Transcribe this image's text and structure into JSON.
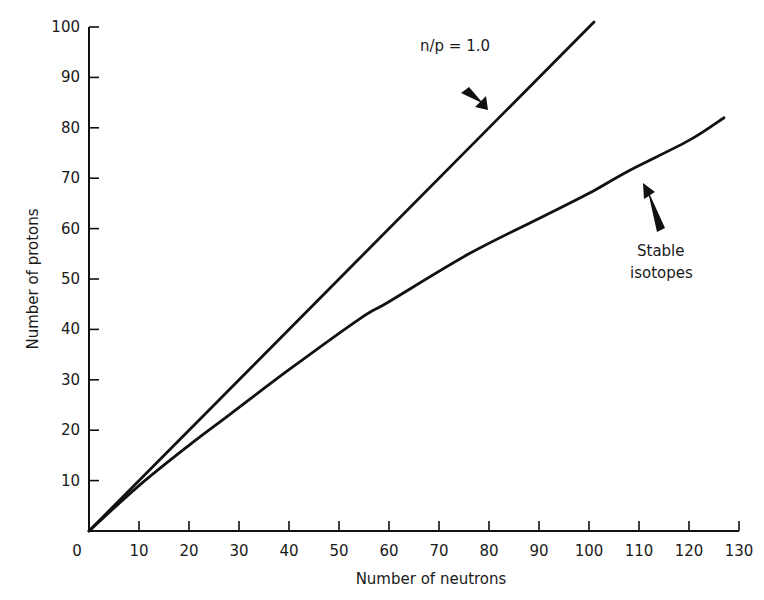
{
  "chart_data": {
    "type": "line",
    "title": "",
    "xlabel": "Number of neutrons",
    "ylabel": "Number of protons",
    "xlim": [
      0,
      130
    ],
    "ylim": [
      0,
      100
    ],
    "xticks": [
      0,
      10,
      20,
      30,
      40,
      50,
      60,
      70,
      80,
      90,
      100,
      110,
      120,
      130
    ],
    "yticks": [
      10,
      20,
      30,
      40,
      50,
      60,
      70,
      80,
      90,
      100
    ],
    "grid": false,
    "legend": null,
    "series": [
      {
        "name": "n/p = 1.0",
        "x": [
          0,
          101
        ],
        "y": [
          0,
          101
        ]
      },
      {
        "name": "Stable isotopes",
        "x": [
          0,
          10,
          20,
          28,
          40,
          54,
          60,
          76,
          90,
          100,
          108,
          120,
          127
        ],
        "y": [
          0,
          9,
          17,
          23,
          32,
          42,
          45.5,
          55,
          62,
          67,
          71.5,
          77.5,
          82
        ]
      }
    ],
    "annotations": [
      {
        "text": "n/p = 1.0",
        "arrow_to": [
          80,
          83
        ]
      },
      {
        "text": "Stable isotopes",
        "arrow_to": [
          112,
          70
        ]
      }
    ]
  },
  "labels": {
    "x_axis": "Number of neutrons",
    "y_axis": "Number of protons",
    "annotation_ratio": "n/p = 1.0",
    "annotation_stable_line1": "Stable",
    "annotation_stable_line2": "isotopes"
  },
  "colors": {
    "line": "#111111",
    "axis": "#111111",
    "background": "#ffffff"
  }
}
